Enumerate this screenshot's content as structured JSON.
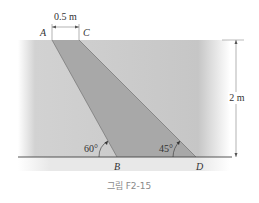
{
  "figure": {
    "caption": "그림 F2-15",
    "points": {
      "A": "A",
      "B": "B",
      "C": "C",
      "D": "D"
    },
    "dimensions": {
      "top_width": "0.5 m",
      "height": "2 m"
    },
    "angles": {
      "at_B": "60°",
      "at_D": "45°"
    },
    "colors": {
      "fluid": "#c9c9c9",
      "gate": "#a6a6a6",
      "ground": "#e6e6e6",
      "line": "#555555"
    }
  }
}
